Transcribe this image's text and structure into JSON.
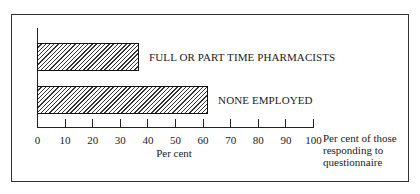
{
  "chart_data": {
    "type": "bar",
    "orientation": "horizontal",
    "categories": [
      "FULL OR PART TIME PHARMACISTS",
      "NONE EMPLOYED"
    ],
    "values": [
      37,
      62
    ],
    "title": "",
    "xlabel": "Per cent",
    "ylabel": "",
    "xlim": [
      0,
      100
    ],
    "xticks": [
      0,
      10,
      20,
      30,
      40,
      50,
      60,
      70,
      80,
      90,
      100
    ],
    "annotation": "Per cent of those responding to questionnaire",
    "grid": false,
    "legend": "none",
    "bar_fill": "diagonal hatching"
  },
  "labels": {
    "bar1": "FULL OR PART TIME PHARMACISTS",
    "bar2": "NONE EMPLOYED",
    "xlabel": "Per cent",
    "note_line1": "Per cent of those",
    "note_line2": "responding to",
    "note_line3": "questionnaire"
  },
  "ticks": [
    "0",
    "10",
    "20",
    "30",
    "40",
    "50",
    "60",
    "70",
    "80",
    "90",
    "100"
  ]
}
